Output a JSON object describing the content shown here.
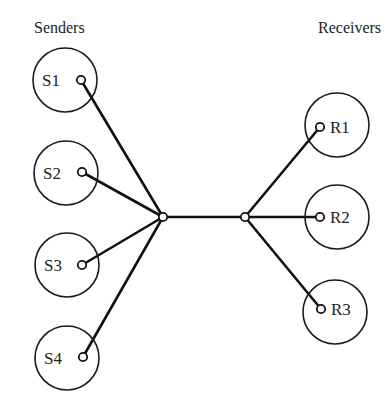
{
  "headers": {
    "senders": "Senders",
    "receivers": "Receivers"
  },
  "senders": [
    {
      "id": "S1",
      "label": "S1",
      "cx": 65,
      "cy": 80,
      "r": 32,
      "px": 81,
      "py": 80
    },
    {
      "id": "S2",
      "label": "S2",
      "cx": 66,
      "cy": 173,
      "r": 32,
      "px": 82,
      "py": 172
    },
    {
      "id": "S3",
      "label": "S3",
      "cx": 67,
      "cy": 265,
      "r": 32,
      "px": 82,
      "py": 265
    },
    {
      "id": "S4",
      "label": "S4",
      "cx": 67,
      "cy": 358,
      "r": 32,
      "px": 83,
      "py": 357
    }
  ],
  "receivers": [
    {
      "id": "R1",
      "label": "R1",
      "cx": 337,
      "cy": 125,
      "r": 32,
      "px": 320,
      "py": 127
    },
    {
      "id": "R2",
      "label": "R2",
      "cx": 337,
      "cy": 217,
      "r": 32,
      "px": 320,
      "py": 217
    },
    {
      "id": "R3",
      "label": "R3",
      "cx": 335,
      "cy": 312,
      "r": 32,
      "px": 321,
      "py": 309
    }
  ],
  "hubs": [
    {
      "id": "hub-sender",
      "x": 163,
      "y": 217
    },
    {
      "id": "hub-receiver",
      "x": 245,
      "y": 217
    }
  ],
  "colors": {
    "line": "#111111",
    "text": "#222222",
    "background": "#ffffff"
  }
}
